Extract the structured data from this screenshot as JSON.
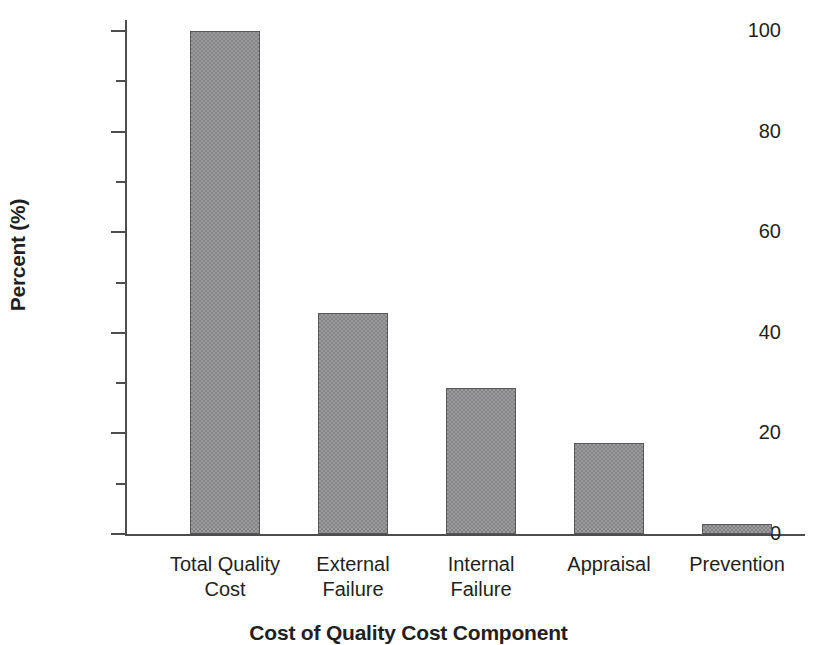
{
  "chart_data": {
    "type": "bar",
    "title": "",
    "xlabel": "Cost of Quality Cost Component",
    "ylabel": "Percent (%)",
    "categories": [
      "Total Quality Cost",
      "External Failure",
      "Internal Failure",
      "Appraisal",
      "Prevention"
    ],
    "category_lines": [
      [
        "Total Quality",
        "Cost"
      ],
      [
        "External",
        "Failure"
      ],
      [
        "Internal",
        "Failure"
      ],
      [
        "Appraisal"
      ],
      [
        "Prevention"
      ]
    ],
    "values": [
      100,
      44,
      29,
      18,
      2
    ],
    "ylim": [
      0,
      100
    ],
    "y_major_ticks": [
      0,
      20,
      40,
      60,
      80,
      100
    ],
    "y_minor_ticks": [
      10,
      30,
      50,
      70,
      90
    ],
    "y_tick_labels": [
      "0",
      "20",
      "40",
      "60",
      "80",
      "100"
    ],
    "grid": false,
    "legend": false,
    "colors": {
      "bar_fill": "#8e8e90",
      "bar_edge": "#58585a",
      "axis": "#4d4d4d",
      "text": "#231f20",
      "background": "#ffffff"
    }
  }
}
